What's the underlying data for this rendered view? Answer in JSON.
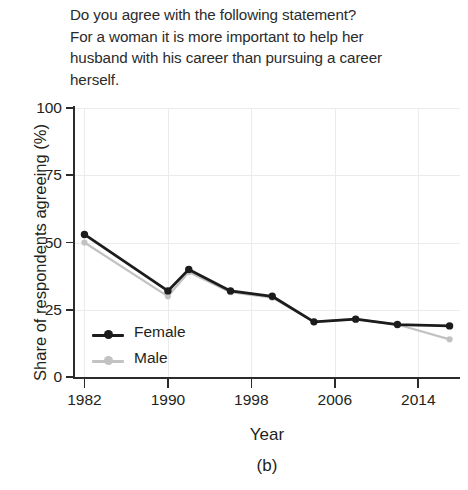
{
  "title": {
    "lines": [
      "Do you agree with the following statement?",
      "For a woman it is more important to help her",
      "husband with his career than pursuing a career",
      "herself."
    ]
  },
  "axes": {
    "ylabel": "Share of respondents agreeing (%)",
    "xlabel": "Year",
    "panel_caption": "(b)",
    "y_ticks": [
      "0",
      "25",
      "50",
      "75",
      "100"
    ],
    "x_ticks": [
      "1982",
      "1990",
      "1998",
      "2006",
      "2014"
    ]
  },
  "legend": {
    "items": [
      {
        "label": "Female",
        "color": "#1c1c1c"
      },
      {
        "label": "Male",
        "color": "#c2c2c2"
      }
    ]
  },
  "chart_data": {
    "type": "line",
    "title": "Do you agree with the following statement? For a woman it is more important to help her husband with his career than pursuing a career herself.",
    "xlabel": "Year",
    "ylabel": "Share of respondents agreeing (%)",
    "xlim": [
      1981,
      2018
    ],
    "ylim": [
      0,
      100
    ],
    "grid": true,
    "legend_position": "inside-lower-left",
    "panel_caption": "(b)",
    "x": [
      1982,
      1990,
      1992,
      1996,
      2000,
      2004,
      2008,
      2012,
      2017
    ],
    "series": [
      {
        "name": "Female",
        "color": "#1c1c1c",
        "values": [
          53,
          32,
          40,
          32,
          30,
          20.5,
          21.5,
          19.5,
          19
        ]
      },
      {
        "name": "Male",
        "color": "#c2c2c2",
        "values": [
          50,
          30,
          39,
          31.5,
          29.5,
          20.5,
          21.5,
          19.5,
          14
        ]
      }
    ]
  }
}
